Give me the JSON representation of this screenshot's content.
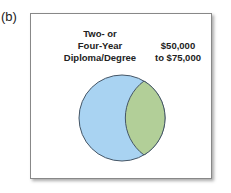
{
  "panel_label": "(b)",
  "sets": [
    {
      "name": "set-a",
      "label_lines": "Two- or\nFour-Year\nDiploma/Degree",
      "color": "#a9d3f2"
    },
    {
      "name": "set-b",
      "label_lines": "$50,000\nto $75,000",
      "color": "#b2cf98"
    }
  ],
  "colors": {
    "outline": "#445566",
    "border": "#888888"
  }
}
